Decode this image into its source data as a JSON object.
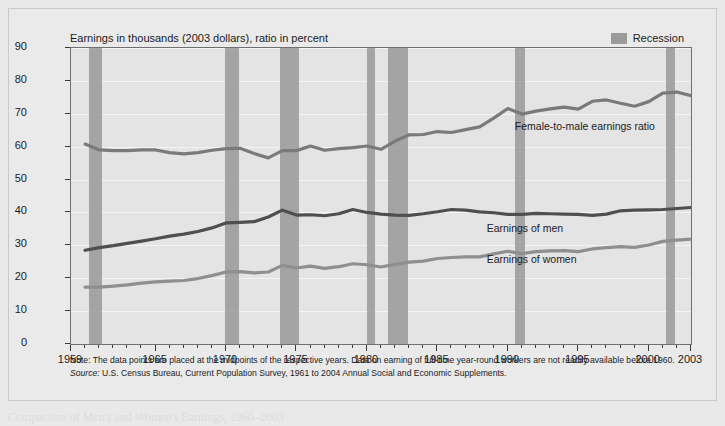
{
  "figure": {
    "y_axis_title": "Median Annual Earnings, 1998 Dollars (thousands)",
    "chart_title": "Earnings in thousands (2003 dollars), ratio in percent",
    "legend_label": "Recession",
    "note": "Note: The data points are placed at the midpoints of the respective years. Data on earning of full-time year-round workers are not readily available before 1960.",
    "source_prefix": "Source:",
    "source_text": " U.S. Census Bureau, Current Population Survey, 1961 to 2004 Annual Social and Economic Supplements.",
    "caption": "Comparison of Men's and Women's Earnings, 1960–2003",
    "colors": {
      "recession_band": "#9e9e9e",
      "earnings_men": "#4f4f4f",
      "earnings_women": "#8f8f8f",
      "ratio": "#7a7a7a",
      "plot_background": "#e4e4e4",
      "panel_background": "#eaeaea"
    }
  },
  "chart_data": {
    "type": "line",
    "title": "Earnings in thousands (2003 dollars), ratio in percent",
    "xlabel": "",
    "ylabel": "Median Annual Earnings, 1998 Dollars (thousands)",
    "xlim": [
      1959,
      2003
    ],
    "ylim": [
      0,
      90
    ],
    "yticks": [
      0,
      10,
      20,
      30,
      40,
      50,
      60,
      70,
      80,
      90
    ],
    "xticks_labeled": [
      1959,
      1965,
      1970,
      1975,
      1980,
      1985,
      1990,
      1995,
      2000,
      2003
    ],
    "xtick_interval": 1,
    "grid": true,
    "legend_position": "top-right",
    "x": [
      1960,
      1961,
      1962,
      1963,
      1964,
      1965,
      1966,
      1967,
      1968,
      1969,
      1970,
      1971,
      1972,
      1973,
      1974,
      1975,
      1976,
      1977,
      1978,
      1979,
      1980,
      1981,
      1982,
      1983,
      1984,
      1985,
      1986,
      1987,
      1988,
      1989,
      1990,
      1991,
      1992,
      1993,
      1994,
      1995,
      1996,
      1997,
      1998,
      1999,
      2000,
      2001,
      2002,
      2003
    ],
    "series": [
      {
        "name": "Female-to-male earnings ratio",
        "color": "#7a7a7a",
        "unit": "percent",
        "values": [
          60.8,
          59.0,
          58.8,
          58.8,
          59.0,
          59.0,
          58.2,
          57.8,
          58.2,
          58.9,
          59.4,
          59.5,
          57.9,
          56.6,
          58.8,
          58.8,
          60.2,
          58.9,
          59.4,
          59.7,
          60.2,
          59.2,
          61.7,
          63.6,
          63.7,
          64.6,
          64.3,
          65.2,
          66.0,
          68.7,
          71.6,
          69.9,
          70.8,
          71.5,
          72.0,
          71.4,
          73.8,
          74.2,
          73.2,
          72.3,
          73.7,
          76.3,
          76.6,
          75.5
        ]
      },
      {
        "name": "Earnings of men",
        "color": "#4f4f4f",
        "unit": "thousands of dollars",
        "values": [
          28.5,
          29.3,
          29.9,
          30.6,
          31.3,
          32.0,
          32.8,
          33.4,
          34.2,
          35.3,
          36.8,
          37.0,
          37.2,
          38.6,
          40.7,
          39.2,
          39.3,
          39.0,
          39.6,
          40.9,
          40.0,
          39.5,
          39.2,
          39.1,
          39.6,
          40.2,
          40.9,
          40.7,
          40.2,
          39.9,
          39.4,
          39.4,
          39.7,
          39.6,
          39.5,
          39.4,
          39.1,
          39.5,
          40.5,
          40.7,
          40.8,
          40.9,
          41.2,
          41.5
        ]
      },
      {
        "name": "Earnings of women",
        "color": "#8f8f8f",
        "unit": "thousands of dollars",
        "values": [
          17.3,
          17.3,
          17.6,
          18.0,
          18.5,
          18.9,
          19.1,
          19.3,
          19.9,
          20.8,
          21.9,
          22.0,
          21.6,
          21.9,
          23.9,
          23.1,
          23.7,
          23.0,
          23.5,
          24.4,
          24.1,
          23.4,
          24.2,
          24.9,
          25.2,
          26.0,
          26.3,
          26.5,
          26.5,
          27.4,
          28.2,
          27.5,
          28.1,
          28.3,
          28.4,
          28.1,
          28.9,
          29.3,
          29.6,
          29.4,
          30.1,
          31.2,
          31.6,
          31.9
        ]
      }
    ],
    "annotations": [
      {
        "text": "Female-to-male earnings ratio",
        "x": 1990.5,
        "y": 66
      },
      {
        "text": "Earnings of men",
        "x": 1988.5,
        "y": 35
      },
      {
        "text": "Earnings of women",
        "x": 1988.5,
        "y": 25.5
      }
    ],
    "recession_bands": [
      {
        "start": 1960.3,
        "end": 1961.2
      },
      {
        "start": 1969.9,
        "end": 1970.9
      },
      {
        "start": 1973.8,
        "end": 1975.2
      },
      {
        "start": 1980.0,
        "end": 1980.6
      },
      {
        "start": 1981.5,
        "end": 1982.9
      },
      {
        "start": 1990.5,
        "end": 1991.2
      },
      {
        "start": 2001.2,
        "end": 2001.9
      }
    ]
  }
}
